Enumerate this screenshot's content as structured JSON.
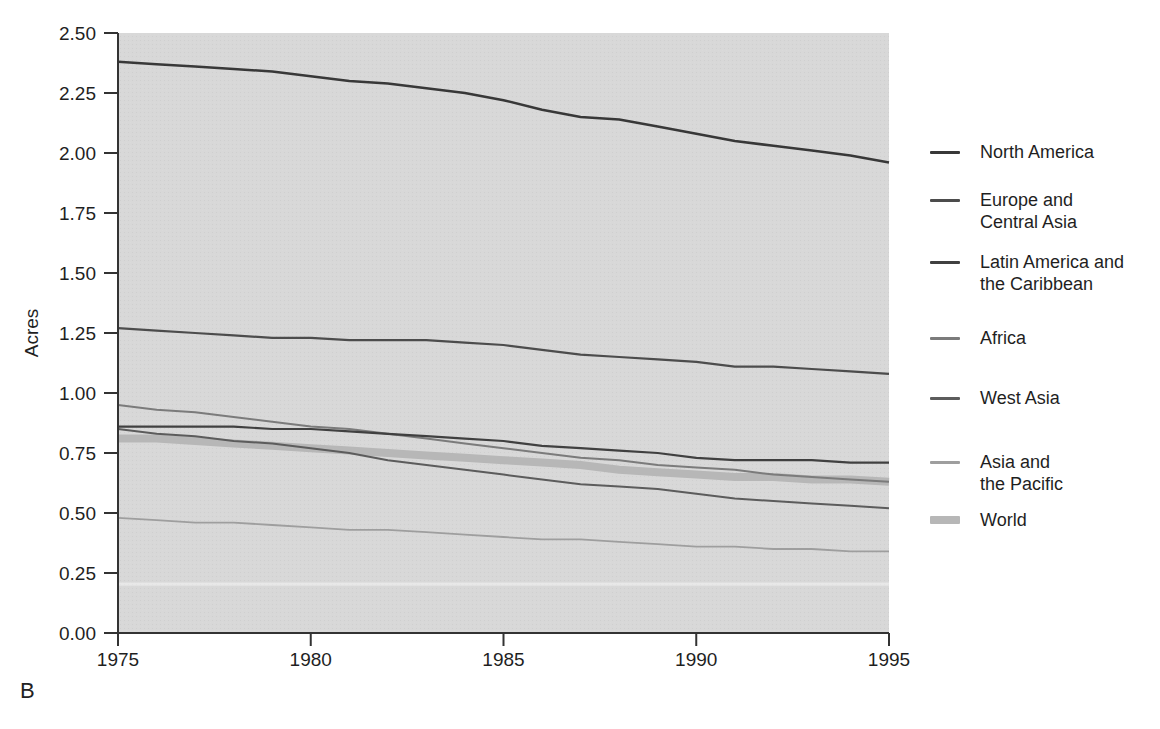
{
  "figure": {
    "panel_label": "B",
    "text_color": "#1f1f1f",
    "axis_color": "#333333"
  },
  "chart_data": {
    "type": "line",
    "title": "",
    "xlabel": "",
    "ylabel": "Acres",
    "xlim": [
      1975,
      1995
    ],
    "ylim": [
      0.0,
      2.5
    ],
    "xticks": [
      "1975",
      "1980",
      "1985",
      "1990",
      "1995"
    ],
    "yticks": [
      "2.50",
      "2.25",
      "2.00",
      "1.75",
      "1.50",
      "1.25",
      "1.00",
      "0.75",
      "0.50",
      "0.25",
      "0.00"
    ],
    "grid": false,
    "legend_position": "right",
    "plot_bg": "#d8d8d8",
    "x": [
      1975,
      1976,
      1977,
      1978,
      1979,
      1980,
      1981,
      1982,
      1983,
      1984,
      1985,
      1986,
      1987,
      1988,
      1989,
      1990,
      1991,
      1992,
      1993,
      1994,
      1995
    ],
    "series": [
      {
        "name": "North America",
        "label_lines": [
          "North America"
        ],
        "color": "#383838",
        "width": 2.5,
        "values": [
          2.38,
          2.37,
          2.36,
          2.35,
          2.34,
          2.32,
          2.3,
          2.29,
          2.27,
          2.25,
          2.22,
          2.18,
          2.15,
          2.14,
          2.11,
          2.08,
          2.05,
          2.03,
          2.01,
          1.99,
          1.96
        ]
      },
      {
        "name": "Europe and Central Asia",
        "label_lines": [
          "Europe and",
          "Central Asia"
        ],
        "color": "#4c4c4c",
        "width": 2.2,
        "values": [
          1.27,
          1.26,
          1.25,
          1.24,
          1.23,
          1.23,
          1.22,
          1.22,
          1.22,
          1.21,
          1.2,
          1.18,
          1.16,
          1.15,
          1.14,
          1.13,
          1.11,
          1.11,
          1.1,
          1.09,
          1.08
        ]
      },
      {
        "name": "Latin America and the Caribbean",
        "label_lines": [
          "Latin America and",
          "the Caribbean"
        ],
        "color": "#404040",
        "width": 2.2,
        "values": [
          0.86,
          0.86,
          0.86,
          0.86,
          0.85,
          0.85,
          0.84,
          0.83,
          0.82,
          0.81,
          0.8,
          0.78,
          0.77,
          0.76,
          0.75,
          0.73,
          0.72,
          0.72,
          0.72,
          0.71,
          0.71
        ]
      },
      {
        "name": "Africa",
        "label_lines": [
          "Africa"
        ],
        "color": "#7b7b7b",
        "width": 2.0,
        "values": [
          0.95,
          0.93,
          0.92,
          0.9,
          0.88,
          0.86,
          0.85,
          0.83,
          0.81,
          0.79,
          0.77,
          0.75,
          0.73,
          0.72,
          0.7,
          0.69,
          0.68,
          0.66,
          0.65,
          0.64,
          0.63
        ]
      },
      {
        "name": "West Asia",
        "label_lines": [
          "West Asia"
        ],
        "color": "#5c5c5c",
        "width": 2.0,
        "values": [
          0.85,
          0.83,
          0.82,
          0.8,
          0.79,
          0.77,
          0.75,
          0.72,
          0.7,
          0.68,
          0.66,
          0.64,
          0.62,
          0.61,
          0.6,
          0.58,
          0.56,
          0.55,
          0.54,
          0.53,
          0.52
        ]
      },
      {
        "name": "Asia and the Pacific",
        "label_lines": [
          "Asia and",
          "the Pacific"
        ],
        "color": "#9e9e9e",
        "width": 1.8,
        "values": [
          0.48,
          0.47,
          0.46,
          0.46,
          0.45,
          0.44,
          0.43,
          0.43,
          0.42,
          0.41,
          0.4,
          0.39,
          0.39,
          0.38,
          0.37,
          0.36,
          0.36,
          0.35,
          0.35,
          0.34,
          0.34
        ]
      },
      {
        "name": "World",
        "label_lines": [
          "World"
        ],
        "color": "#b7b7b7",
        "width": 8.0,
        "values": [
          0.81,
          0.81,
          0.8,
          0.79,
          0.78,
          0.77,
          0.76,
          0.75,
          0.74,
          0.73,
          0.72,
          0.71,
          0.7,
          0.68,
          0.67,
          0.66,
          0.65,
          0.65,
          0.64,
          0.64,
          0.63
        ]
      }
    ]
  }
}
